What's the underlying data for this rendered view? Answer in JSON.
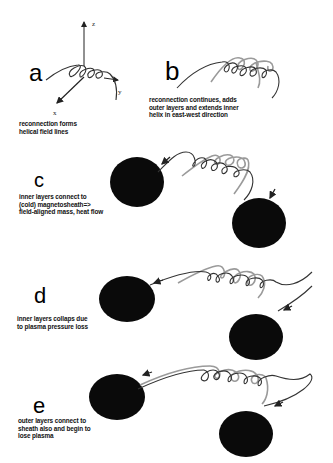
{
  "figure": {
    "colors": {
      "dark_line": "#333333",
      "light_line": "#999999",
      "blob": "#0a0a0a",
      "text": "#111111"
    },
    "axes": {
      "z_label": "z",
      "y_label": "y",
      "x_label": "x"
    },
    "panels": [
      {
        "letter": "a",
        "caption": "reconnection forms\nhelical field lines"
      },
      {
        "letter": "b",
        "caption": "reconnection continues, adds\nouter layers and extends inner\nhelix in east-west direction"
      },
      {
        "letter": "c",
        "caption": "inner layers connect to\n(cold) magnetosheath=>\nfield-aligned mass, heat flow"
      },
      {
        "letter": "d",
        "caption": "inner layers collaps due\nto plasma pressure loss"
      },
      {
        "letter": "e",
        "caption": "outer layers connect to\nsheath also and begin to\nlose plasma"
      }
    ]
  }
}
